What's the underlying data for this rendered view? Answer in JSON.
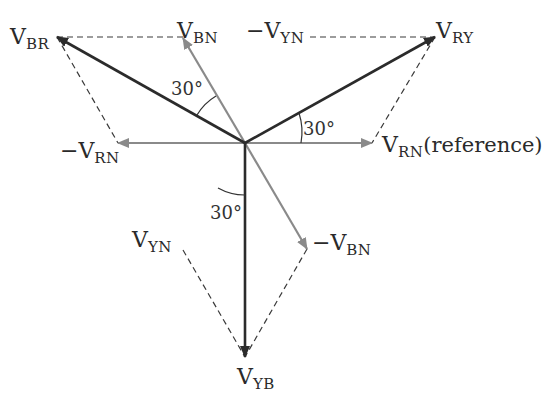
{
  "diagram": {
    "type": "phasor-diagram",
    "origin": [
      245,
      143
    ],
    "colors": {
      "line_voltage": "#2b2b2b",
      "phase_voltage": "#8a8a8a",
      "construction": "#3a3a3a"
    },
    "phasors": [
      {
        "id": "V_RY",
        "kind": "line",
        "tip": [
          435,
          37
        ]
      },
      {
        "id": "V_BR",
        "kind": "line",
        "tip": [
          57,
          37
        ]
      },
      {
        "id": "V_YB",
        "kind": "line",
        "tip": [
          245,
          357
        ]
      },
      {
        "id": "V_RN",
        "kind": "phase",
        "tip": [
          372,
          143
        ]
      },
      {
        "id": "-V_RN",
        "kind": "phase",
        "tip": [
          118,
          143
        ]
      },
      {
        "id": "V_BN",
        "kind": "phase",
        "tip": [
          183,
          38
        ]
      },
      {
        "id": "-V_BN",
        "kind": "phase",
        "tip": [
          307,
          249
        ]
      }
    ],
    "dashed_lines": [
      [
        [
          57,
          37
        ],
        [
          183,
          37
        ]
      ],
      [
        [
          57,
          37
        ],
        [
          118,
          143
        ]
      ],
      [
        [
          310,
          37
        ],
        [
          435,
          37
        ]
      ],
      [
        [
          435,
          37
        ],
        [
          372,
          143
        ]
      ],
      [
        [
          183,
          250
        ],
        [
          245,
          357
        ]
      ],
      [
        [
          307,
          249
        ],
        [
          245,
          357
        ]
      ]
    ],
    "angles": [
      "30°",
      "30°",
      "30°"
    ]
  },
  "labels": {
    "v_br": {
      "main": "V",
      "sub": "BR"
    },
    "v_bn": {
      "main": "V",
      "sub": "BN"
    },
    "neg_v_yn": {
      "main": "−V",
      "sub": "YN"
    },
    "v_ry": {
      "main": "V",
      "sub": "RY"
    },
    "neg_v_rn": {
      "main": "−V",
      "sub": "RN"
    },
    "v_rn": {
      "main": "V",
      "sub": "RN",
      "suffix": "(reference)"
    },
    "v_yn": {
      "main": "V",
      "sub": "YN"
    },
    "neg_v_bn": {
      "main": "−V",
      "sub": "BN"
    },
    "v_yb": {
      "main": "V",
      "sub": "YB"
    },
    "angle_vbr_vbn": "30°",
    "angle_vry_vrn": "30°",
    "angle_vyb_negvbn": "30°"
  }
}
